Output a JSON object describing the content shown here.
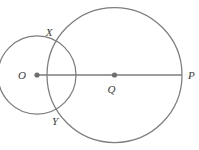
{
  "figure": {
    "background_color": "#ffffff",
    "stroke_color": "#7d7d7d",
    "label_color": "#3a3a3a",
    "width": 199,
    "height": 150
  },
  "labels": {
    "o": "O",
    "q": "Q",
    "p": "P",
    "x": "X",
    "y": "Y"
  },
  "chart_data": {
    "type": "diagram",
    "subtype": "euclidean-geometry",
    "units": "pixels",
    "shapes": [
      {
        "name": "small-circle",
        "kind": "circle",
        "center_label": "O",
        "cx": 37,
        "cy": 75,
        "r": 39,
        "stroke": "#7d7d7d"
      },
      {
        "name": "large-circle",
        "kind": "circle",
        "center_label": "Q",
        "cx": 114.5,
        "cy": 75,
        "r": 67.5,
        "stroke": "#7d7d7d"
      },
      {
        "name": "segment-op",
        "kind": "segment",
        "from_label": "O",
        "to_label": "P",
        "x1": 37,
        "y1": 75,
        "x2": 182,
        "y2": 75,
        "stroke": "#7d7d7d"
      }
    ],
    "points": [
      {
        "label": "O",
        "x": 37,
        "y": 75,
        "role": "center-of-small-circle",
        "marker": "filled-dot",
        "label_dx": -11,
        "label_dy": 4
      },
      {
        "label": "Q",
        "x": 114.5,
        "y": 75,
        "role": "center-of-large-circle",
        "marker": "filled-dot",
        "label_dx": -3,
        "label_dy": 18
      },
      {
        "label": "P",
        "x": 182,
        "y": 75,
        "role": "endpoint-on-large-circle",
        "marker": "none",
        "label_dx": 6,
        "label_dy": 4
      },
      {
        "label": "X",
        "x": 58,
        "y": 41,
        "role": "upper-intersection-of-circles",
        "marker": "none",
        "label_dx": -9,
        "label_dy": -5
      },
      {
        "label": "Y",
        "x": 58,
        "y": 109,
        "role": "lower-intersection-of-circles",
        "marker": "none",
        "label_dx": -3,
        "label_dy": 16
      }
    ],
    "legend": [],
    "grid": false
  }
}
